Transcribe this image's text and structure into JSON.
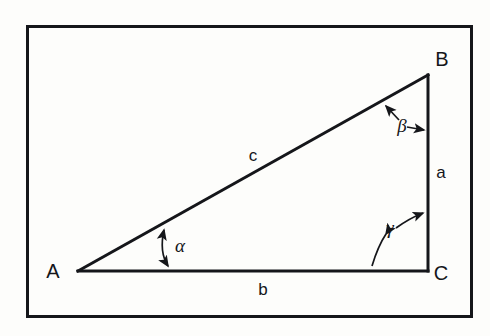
{
  "figure": {
    "type": "geometric-diagram",
    "background_color": "#fdfdfb",
    "line_color": "#15161a",
    "frame": {
      "name": "figure-border",
      "x": 26,
      "y": 25,
      "width": 447,
      "height": 293,
      "stroke_width": 3
    },
    "triangle": {
      "stroke_width": 3,
      "right_angle_at": "C",
      "vertices": [
        {
          "id": "A",
          "label": "A",
          "x": 78,
          "y": 271,
          "label_x": 58,
          "label_y": 278
        },
        {
          "id": "B",
          "label": "B",
          "x": 428,
          "y": 75,
          "label_x": 437,
          "label_y": 66
        },
        {
          "id": "C",
          "label": "C",
          "x": 428,
          "y": 271,
          "label_x": 437,
          "label_y": 279
        }
      ],
      "sides": [
        {
          "id": "a",
          "label": "a",
          "from": "B",
          "to": "C",
          "label_x": 437,
          "label_y": 178
        },
        {
          "id": "b",
          "label": "b",
          "from": "A",
          "to": "C",
          "label_x": 259,
          "label_y": 294
        },
        {
          "id": "c",
          "label": "c",
          "from": "A",
          "to": "B",
          "label_x": 249,
          "label_y": 161
        }
      ],
      "angles": [
        {
          "id": "alpha",
          "label": "α",
          "at_vertex": "A",
          "label_x": 172,
          "label_y": 251
        },
        {
          "id": "beta",
          "label": "β",
          "at_vertex": "B",
          "label_x": 394,
          "label_y": 131
        },
        {
          "id": "gamma",
          "label": "γ",
          "at_vertex": "C",
          "label_x": 382,
          "label_y": 236
        }
      ]
    }
  }
}
